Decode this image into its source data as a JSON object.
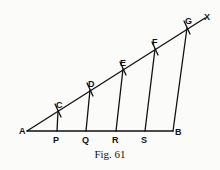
{
  "figure": {
    "caption": "Fig. 61",
    "points": {
      "A": "A",
      "B": "B",
      "X": "X",
      "C": "C",
      "D": "D",
      "E": "E",
      "F": "F",
      "G": "G",
      "P": "P",
      "Q": "Q",
      "R": "R",
      "S": "S"
    }
  }
}
